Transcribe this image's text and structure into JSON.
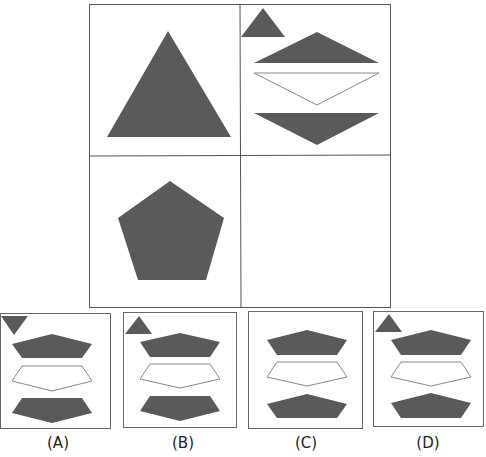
{
  "puzzle": {
    "colors": {
      "fill": "#5a5a5a",
      "stroke": "#6b6b6b",
      "line": "#555555",
      "outline": "#888888"
    },
    "grid": {
      "cells": [
        {
          "position": "top-left",
          "content": "large upward triangle"
        },
        {
          "position": "top-right",
          "content": "small upward triangle + three split triangle segments"
        },
        {
          "position": "bottom-left",
          "content": "pentagon"
        },
        {
          "position": "bottom-right",
          "content": "empty (answer slot)"
        }
      ]
    },
    "options": [
      {
        "label": "(A)",
        "small_triangle": "down",
        "bottom_piece": "point-down"
      },
      {
        "label": "(B)",
        "small_triangle": "up",
        "bottom_piece": "point-down"
      },
      {
        "label": "(C)",
        "small_triangle": "none",
        "bottom_piece": "point-up"
      },
      {
        "label": "(D)",
        "small_triangle": "up",
        "bottom_piece": "point-up"
      }
    ]
  }
}
